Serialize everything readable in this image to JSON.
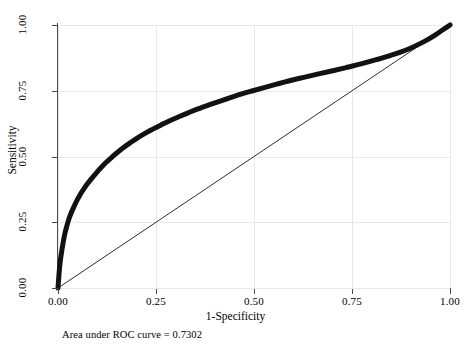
{
  "chart_data": {
    "type": "line",
    "title": "",
    "xlabel": "1-Specificity",
    "ylabel": "Sensitivity",
    "xlim": [
      0,
      1
    ],
    "ylim": [
      0,
      1
    ],
    "grid": true,
    "legend": "none",
    "annotation": "Area under ROC curve = 0.7302",
    "auc": 0.7302,
    "xticks": [
      "0.00",
      "0.25",
      "0.50",
      "0.75",
      "1.00"
    ],
    "xtick_values": [
      0,
      0.25,
      0.5,
      0.75,
      1
    ],
    "yticks": [
      "0.00",
      "0.25",
      "0.50",
      "0.75",
      "1.00"
    ],
    "ytick_values": [
      0,
      0.25,
      0.5,
      0.75,
      1
    ],
    "series": [
      {
        "name": "ROC curve",
        "style": "thick-solid",
        "color": "#121212",
        "linewidth": 5,
        "x": [
          0.0,
          0.003,
          0.006,
          0.01,
          0.014,
          0.018,
          0.023,
          0.028,
          0.034,
          0.041,
          0.048,
          0.056,
          0.065,
          0.075,
          0.086,
          0.098,
          0.11,
          0.123,
          0.137,
          0.152,
          0.168,
          0.185,
          0.203,
          0.222,
          0.242,
          0.263,
          0.285,
          0.308,
          0.332,
          0.357,
          0.383,
          0.41,
          0.438,
          0.467,
          0.497,
          0.528,
          0.56,
          0.593,
          0.627,
          0.662,
          0.698,
          0.735,
          0.773,
          0.812,
          0.852,
          0.893,
          0.93,
          0.96,
          0.98,
          0.992,
          1.0
        ],
        "y": [
          0.0,
          0.06,
          0.105,
          0.145,
          0.18,
          0.21,
          0.238,
          0.263,
          0.287,
          0.31,
          0.332,
          0.354,
          0.375,
          0.396,
          0.417,
          0.438,
          0.458,
          0.478,
          0.497,
          0.516,
          0.535,
          0.553,
          0.571,
          0.588,
          0.604,
          0.62,
          0.636,
          0.651,
          0.666,
          0.681,
          0.695,
          0.709,
          0.723,
          0.737,
          0.75,
          0.763,
          0.776,
          0.789,
          0.801,
          0.813,
          0.825,
          0.838,
          0.852,
          0.868,
          0.886,
          0.908,
          0.934,
          0.96,
          0.98,
          0.992,
          1.0
        ]
      },
      {
        "name": "reference diagonal",
        "style": "thin-solid",
        "color": "#161616",
        "linewidth": 0.9,
        "x": [
          0,
          1
        ],
        "y": [
          0,
          1
        ]
      }
    ]
  },
  "axes": {
    "x": {
      "label": "1-Specificity",
      "ticks": [
        {
          "value": 0.0,
          "label": "0.00"
        },
        {
          "value": 0.25,
          "label": "0.25"
        },
        {
          "value": 0.5,
          "label": "0.50"
        },
        {
          "value": 0.75,
          "label": "0.75"
        },
        {
          "value": 1.0,
          "label": "1.00"
        }
      ]
    },
    "y": {
      "label": "Sensitivity",
      "ticks": [
        {
          "value": 0.0,
          "label": "0.00"
        },
        {
          "value": 0.25,
          "label": "0.25"
        },
        {
          "value": 0.5,
          "label": "0.50"
        },
        {
          "value": 0.75,
          "label": "0.75"
        },
        {
          "value": 1.0,
          "label": "1.00"
        }
      ]
    }
  },
  "caption": {
    "text": "Area under ROC curve = 0.7302"
  },
  "colors": {
    "curve": "#121212",
    "diagonal": "#161616",
    "grid": "#e8e8ea",
    "axis": "#4a4a4a",
    "background": "#ffffff",
    "text": "#000000"
  }
}
